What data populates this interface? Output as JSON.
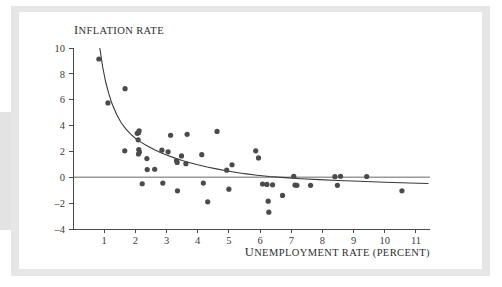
{
  "figure": {
    "background_color": "#ffffff",
    "frame_color": "#e6e6e6",
    "left_band_color": "#e3e3e3"
  },
  "chart_data": {
    "type": "scatter",
    "title": "",
    "xlabel": "Unemployment rate (percent)",
    "ylabel": "Inflation rate",
    "xlabel_display_first": "U",
    "xlabel_display_rest": "NEMPLOYMENT RATE (PERCENT)",
    "ylabel_display_first": "I",
    "ylabel_display_rest": "NFLATION RATE",
    "xlim": [
      0,
      11.45
    ],
    "ylim": [
      -4,
      10
    ],
    "xticks": [
      1,
      2,
      3,
      4,
      5,
      6,
      7,
      8,
      9,
      10,
      11
    ],
    "yticks": [
      10,
      8,
      6,
      4,
      2,
      0,
      -2,
      -4
    ],
    "xtick_labels": [
      "1",
      "2",
      "3",
      "4",
      "5",
      "6",
      "7",
      "8",
      "9",
      "10",
      "11"
    ],
    "ytick_labels": [
      "10",
      "8",
      "6",
      "4",
      "2",
      "0",
      "–2",
      "–4"
    ],
    "grid": false,
    "legend": null,
    "marker_color": "#4b4b4b",
    "marker_radius": 2.6,
    "zero_line": {
      "y": 0,
      "color": "#9a9a9a",
      "x_start": 0,
      "x_end": 11.45
    },
    "fit_curve": {
      "label": "fitted Phillips curve",
      "color": "#3a3a3a",
      "points": [
        [
          0.86,
          10.0
        ],
        [
          0.95,
          8.55
        ],
        [
          1.05,
          7.35
        ],
        [
          1.15,
          6.45
        ],
        [
          1.25,
          5.7
        ],
        [
          1.4,
          4.85
        ],
        [
          1.55,
          4.2
        ],
        [
          1.7,
          3.72
        ],
        [
          1.85,
          3.34
        ],
        [
          2.0,
          3.02
        ],
        [
          2.2,
          2.68
        ],
        [
          2.4,
          2.4
        ],
        [
          2.6,
          2.15
        ],
        [
          2.8,
          1.92
        ],
        [
          3.0,
          1.72
        ],
        [
          3.25,
          1.5
        ],
        [
          3.5,
          1.3
        ],
        [
          3.75,
          1.13
        ],
        [
          4.0,
          0.97
        ],
        [
          4.3,
          0.8
        ],
        [
          4.6,
          0.65
        ],
        [
          4.9,
          0.51
        ],
        [
          5.2,
          0.39
        ],
        [
          5.5,
          0.28
        ],
        [
          5.9,
          0.16
        ],
        [
          6.3,
          0.06
        ],
        [
          6.8,
          -0.03
        ],
        [
          7.3,
          -0.11
        ],
        [
          7.9,
          -0.18
        ],
        [
          8.5,
          -0.25
        ],
        [
          9.2,
          -0.31
        ],
        [
          10.0,
          -0.38
        ],
        [
          10.8,
          -0.44
        ],
        [
          11.4,
          -0.48
        ]
      ]
    },
    "points": [
      [
        0.83,
        9.15
      ],
      [
        1.12,
        5.75
      ],
      [
        1.67,
        6.85
      ],
      [
        1.66,
        2.05
      ],
      [
        2.06,
        3.4
      ],
      [
        2.1,
        3.45
      ],
      [
        2.12,
        3.6
      ],
      [
        2.09,
        2.9
      ],
      [
        2.11,
        2.15
      ],
      [
        2.13,
        1.95
      ],
      [
        2.1,
        1.8
      ],
      [
        2.22,
        -0.5
      ],
      [
        2.37,
        1.45
      ],
      [
        2.38,
        0.6
      ],
      [
        2.62,
        0.62
      ],
      [
        2.85,
        2.1
      ],
      [
        2.88,
        -0.45
      ],
      [
        3.05,
        1.97
      ],
      [
        3.13,
        3.25
      ],
      [
        3.32,
        1.3
      ],
      [
        3.34,
        1.15
      ],
      [
        3.35,
        -1.05
      ],
      [
        3.48,
        1.65
      ],
      [
        3.62,
        1.05
      ],
      [
        3.66,
        3.32
      ],
      [
        4.13,
        1.75
      ],
      [
        4.18,
        -0.45
      ],
      [
        4.32,
        -1.9
      ],
      [
        4.62,
        3.55
      ],
      [
        4.93,
        0.55
      ],
      [
        5.0,
        -0.92
      ],
      [
        5.1,
        0.97
      ],
      [
        5.86,
        2.05
      ],
      [
        5.95,
        1.5
      ],
      [
        6.08,
        -0.52
      ],
      [
        6.22,
        -0.55
      ],
      [
        6.26,
        -1.85
      ],
      [
        6.28,
        -2.7
      ],
      [
        6.4,
        -0.58
      ],
      [
        6.72,
        -1.4
      ],
      [
        7.08,
        0.08
      ],
      [
        7.12,
        -0.6
      ],
      [
        7.18,
        -0.62
      ],
      [
        7.62,
        -0.62
      ],
      [
        8.4,
        0.05
      ],
      [
        8.48,
        -0.62
      ],
      [
        8.58,
        0.08
      ],
      [
        9.42,
        0.06
      ],
      [
        10.55,
        -1.05
      ]
    ]
  }
}
